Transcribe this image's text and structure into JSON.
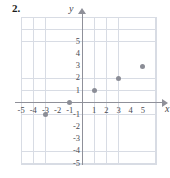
{
  "exercise": {
    "number": "2."
  },
  "chart_data": {
    "type": "scatter",
    "title": "",
    "xlabel": "x",
    "ylabel": "y",
    "grid": true,
    "legend": "none",
    "xlim": [
      -5.5,
      6
    ],
    "ylim": [
      -6,
      6
    ],
    "xticks": [
      -5,
      -4,
      -3,
      -2,
      -1,
      1,
      2,
      3,
      4,
      5
    ],
    "yticks": [
      5,
      4,
      3,
      2,
      1,
      -1,
      -2,
      -3,
      -4,
      -5
    ],
    "xtick_labels": [
      "-5",
      "-4",
      "-3",
      "-2",
      "-1",
      "1",
      "2",
      "3",
      "4",
      "5"
    ],
    "ytick_labels": [
      "5",
      "4",
      "3",
      "2",
      "1",
      "-1",
      "-2",
      "-3",
      "-4",
      "-5"
    ],
    "points": [
      {
        "x": -3,
        "y": -1
      },
      {
        "x": -1,
        "y": 0
      },
      {
        "x": 1,
        "y": 1
      },
      {
        "x": 3,
        "y": 2
      },
      {
        "x": 5,
        "y": 3
      }
    ],
    "point_color": "#8b8d96",
    "grid_color": "#d8dce4",
    "axis_color": "#8f9099"
  }
}
